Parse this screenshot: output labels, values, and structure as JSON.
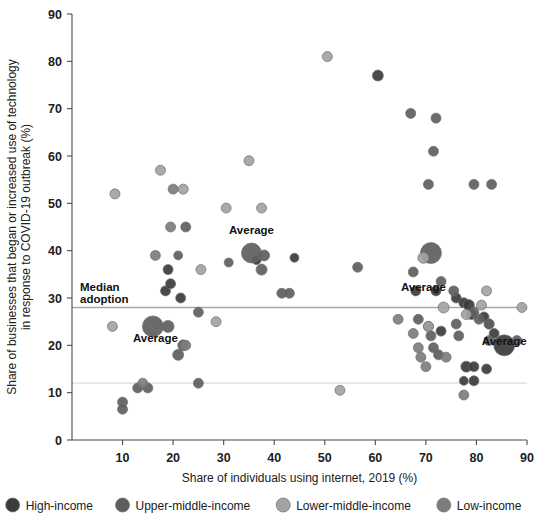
{
  "chart_data": {
    "type": "scatter",
    "title": "",
    "xlabel": "Share of individuals using internet, 2019 (%)",
    "ylabel": "Share of businesses that began or increased use of technology in response to COVID-19 outbreak (%)",
    "ylabel_line1": "Share of businesses that began or increased use of technology",
    "ylabel_line2": "in response to COVID-19 outbreak (%)",
    "xlim": [
      0,
      90
    ],
    "ylim": [
      0,
      90
    ],
    "xticks": [
      10,
      20,
      30,
      40,
      50,
      60,
      70,
      80,
      90
    ],
    "yticks": [
      0,
      10,
      20,
      30,
      40,
      50,
      60,
      70,
      80,
      90
    ],
    "grid": false,
    "legend_position": "bottom",
    "reference_lines": [
      {
        "name": "median-adoption-line",
        "orientation": "horizontal",
        "value": 28,
        "label": "Median\nadoption",
        "label_line1": "Median",
        "label_line2": "adoption",
        "color": "#a8a8a8"
      },
      {
        "name": "lower-reference-line",
        "orientation": "horizontal",
        "value": 12,
        "label": "",
        "color": "#dcdcdc"
      }
    ],
    "annotations": [
      {
        "text": "Average",
        "x": 35.5,
        "y": 43.5,
        "series": "Upper-middle-income"
      },
      {
        "text": "Average",
        "x": 16.5,
        "y": 20.8,
        "series": "Low-income"
      },
      {
        "text": "Average",
        "x": 69.5,
        "y": 31.5,
        "series": "Lower-middle-income"
      },
      {
        "text": "Average",
        "x": 85.5,
        "y": 20.0,
        "series": "High-income"
      }
    ],
    "series": [
      {
        "name": "High-income",
        "color": "#3b3b3b",
        "points": [
          {
            "x": 68.0,
            "y": 31.5,
            "r": 5.0
          },
          {
            "x": 72.0,
            "y": 31.5,
            "r": 5.0
          },
          {
            "x": 76.0,
            "y": 30.0,
            "r": 5.0
          },
          {
            "x": 77.5,
            "y": 29.0,
            "r": 5.0
          },
          {
            "x": 78.5,
            "y": 28.5,
            "r": 5.5
          },
          {
            "x": 79.0,
            "y": 26.5,
            "r": 5.0
          },
          {
            "x": 81.5,
            "y": 26.0,
            "r": 5.0
          },
          {
            "x": 82.5,
            "y": 24.5,
            "r": 5.0
          },
          {
            "x": 83.5,
            "y": 22.5,
            "r": 5.0
          },
          {
            "x": 78.0,
            "y": 15.5,
            "r": 5.5
          },
          {
            "x": 79.5,
            "y": 15.5,
            "r": 5.0
          },
          {
            "x": 82.0,
            "y": 15.0,
            "r": 5.0
          },
          {
            "x": 79.5,
            "y": 12.5,
            "r": 5.0
          },
          {
            "x": 77.5,
            "y": 12.5,
            "r": 4.5
          },
          {
            "x": 73.0,
            "y": 23.0,
            "r": 5.0
          },
          {
            "x": 60.5,
            "y": 77.0,
            "r": 5.5
          },
          {
            "x": 36.5,
            "y": 38.0,
            "r": 4.5
          },
          {
            "x": 44.0,
            "y": 38.5,
            "r": 4.5
          },
          {
            "x": 18.5,
            "y": 31.5,
            "r": 5.0
          },
          {
            "x": 19.5,
            "y": 33.0,
            "r": 5.0
          },
          {
            "x": 19.0,
            "y": 36.0,
            "r": 5.0
          },
          {
            "x": 21.5,
            "y": 30.0,
            "r": 5.0
          },
          {
            "x": 85.5,
            "y": 20.0,
            "r": 10.5
          }
        ]
      },
      {
        "name": "Upper-middle-income",
        "color": "#5e5e5e",
        "points": [
          {
            "x": 67.0,
            "y": 69.0,
            "r": 5.0
          },
          {
            "x": 72.0,
            "y": 68.0,
            "r": 5.0
          },
          {
            "x": 71.5,
            "y": 61.0,
            "r": 5.0
          },
          {
            "x": 70.5,
            "y": 54.0,
            "r": 5.0
          },
          {
            "x": 79.5,
            "y": 54.0,
            "r": 5.0
          },
          {
            "x": 83.0,
            "y": 54.0,
            "r": 5.0
          },
          {
            "x": 67.5,
            "y": 35.5,
            "r": 5.0
          },
          {
            "x": 71.0,
            "y": 39.5,
            "r": 10.5
          },
          {
            "x": 73.0,
            "y": 33.5,
            "r": 5.0
          },
          {
            "x": 75.5,
            "y": 31.5,
            "r": 5.0
          },
          {
            "x": 68.5,
            "y": 25.5,
            "r": 5.0
          },
          {
            "x": 70.5,
            "y": 24.0,
            "r": 5.0
          },
          {
            "x": 71.0,
            "y": 22.0,
            "r": 5.0
          },
          {
            "x": 71.5,
            "y": 19.5,
            "r": 5.0
          },
          {
            "x": 72.5,
            "y": 18.0,
            "r": 5.0
          },
          {
            "x": 76.0,
            "y": 24.5,
            "r": 5.0
          },
          {
            "x": 76.5,
            "y": 22.0,
            "r": 5.0
          },
          {
            "x": 79.5,
            "y": 27.0,
            "r": 5.0
          },
          {
            "x": 80.5,
            "y": 25.5,
            "r": 5.0
          },
          {
            "x": 82.5,
            "y": 24.5,
            "r": 5.0
          },
          {
            "x": 82.5,
            "y": 21.0,
            "r": 5.0
          },
          {
            "x": 88.0,
            "y": 21.0,
            "r": 5.0
          },
          {
            "x": 56.5,
            "y": 36.5,
            "r": 5.0
          },
          {
            "x": 35.5,
            "y": 39.5,
            "r": 10.0
          },
          {
            "x": 38.0,
            "y": 39.0,
            "r": 5.5
          },
          {
            "x": 37.5,
            "y": 36.0,
            "r": 5.5
          },
          {
            "x": 31.0,
            "y": 37.5,
            "r": 4.5
          },
          {
            "x": 16.0,
            "y": 24.0,
            "r": 10.5
          },
          {
            "x": 19.0,
            "y": 24.0,
            "r": 6.0
          },
          {
            "x": 22.0,
            "y": 20.0,
            "r": 5.5
          },
          {
            "x": 21.0,
            "y": 18.0,
            "r": 5.5
          },
          {
            "x": 25.0,
            "y": 12.0,
            "r": 5.0
          },
          {
            "x": 13.0,
            "y": 11.0,
            "r": 5.0
          },
          {
            "x": 15.0,
            "y": 11.0,
            "r": 5.0
          },
          {
            "x": 10.0,
            "y": 8.0,
            "r": 5.0
          },
          {
            "x": 10.0,
            "y": 6.5,
            "r": 5.0
          },
          {
            "x": 21.0,
            "y": 39.0,
            "r": 4.5
          },
          {
            "x": 22.5,
            "y": 45.0,
            "r": 5.0
          },
          {
            "x": 25.0,
            "y": 27.0,
            "r": 5.0
          },
          {
            "x": 41.5,
            "y": 31.0,
            "r": 5.0
          },
          {
            "x": 43.0,
            "y": 31.0,
            "r": 5.0
          }
        ]
      },
      {
        "name": "Lower-middle-income",
        "color": "#a3a3a3",
        "points": [
          {
            "x": 50.5,
            "y": 81.0,
            "r": 5.0
          },
          {
            "x": 35.0,
            "y": 59.0,
            "r": 5.0
          },
          {
            "x": 17.5,
            "y": 57.0,
            "r": 5.0
          },
          {
            "x": 8.5,
            "y": 52.0,
            "r": 5.0
          },
          {
            "x": 22.0,
            "y": 53.0,
            "r": 5.0
          },
          {
            "x": 30.5,
            "y": 49.0,
            "r": 5.0
          },
          {
            "x": 37.5,
            "y": 49.0,
            "r": 5.0
          },
          {
            "x": 69.5,
            "y": 38.5,
            "r": 5.5
          },
          {
            "x": 73.5,
            "y": 28.0,
            "r": 5.5
          },
          {
            "x": 70.5,
            "y": 24.0,
            "r": 5.0
          },
          {
            "x": 78.0,
            "y": 26.5,
            "r": 5.0
          },
          {
            "x": 81.0,
            "y": 28.5,
            "r": 5.0
          },
          {
            "x": 89.0,
            "y": 28.0,
            "r": 5.0
          },
          {
            "x": 53.0,
            "y": 10.5,
            "r": 5.0
          },
          {
            "x": 8.0,
            "y": 24.0,
            "r": 5.0
          },
          {
            "x": 28.5,
            "y": 25.0,
            "r": 5.0
          },
          {
            "x": 25.5,
            "y": 36.0,
            "r": 5.0
          },
          {
            "x": 82.0,
            "y": 31.5,
            "r": 5.0
          }
        ]
      },
      {
        "name": "Low-income",
        "color": "#7d7d7d",
        "points": [
          {
            "x": 20.0,
            "y": 53.0,
            "r": 5.0
          },
          {
            "x": 19.5,
            "y": 45.0,
            "r": 5.0
          },
          {
            "x": 16.5,
            "y": 39.0,
            "r": 5.0
          },
          {
            "x": 64.5,
            "y": 25.5,
            "r": 5.0
          },
          {
            "x": 67.5,
            "y": 22.5,
            "r": 5.0
          },
          {
            "x": 68.5,
            "y": 19.5,
            "r": 5.0
          },
          {
            "x": 69.0,
            "y": 17.5,
            "r": 5.0
          },
          {
            "x": 70.0,
            "y": 15.5,
            "r": 5.0
          },
          {
            "x": 74.0,
            "y": 17.5,
            "r": 5.0
          },
          {
            "x": 77.5,
            "y": 9.5,
            "r": 5.0
          },
          {
            "x": 22.5,
            "y": 20.0,
            "r": 5.0
          },
          {
            "x": 14.0,
            "y": 12.0,
            "r": 5.0
          }
        ]
      }
    ]
  },
  "legend": {
    "items": [
      {
        "label": "High-income",
        "color": "#3b3b3b",
        "icon": "circle-marker-icon"
      },
      {
        "label": "Upper-middle-income",
        "color": "#5e5e5e",
        "icon": "circle-marker-icon"
      },
      {
        "label": "Lower-middle-income",
        "color": "#a3a3a3",
        "icon": "circle-marker-icon"
      },
      {
        "label": "Low-income",
        "color": "#7d7d7d",
        "icon": "circle-marker-icon"
      }
    ]
  },
  "colors": {
    "axis": "#4a4a4a",
    "text": "#202020",
    "background": "#ffffff",
    "median_line": "#a8a8a8",
    "lower_line": "#dcdcdc"
  }
}
